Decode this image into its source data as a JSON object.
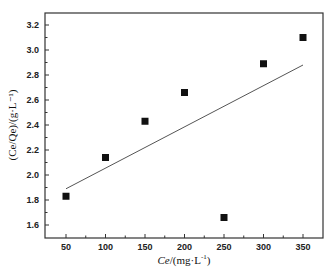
{
  "chart_data": {
    "type": "scatter",
    "title": "",
    "xlabel": "Ce/(mg·L⁻¹)",
    "ylabel": "(Ce/Qe)/(g·L⁻¹)",
    "xlim": [
      25,
      375
    ],
    "ylim": [
      1.5,
      3.3
    ],
    "x_ticks": [
      50,
      100,
      150,
      200,
      250,
      300,
      350
    ],
    "y_ticks": [
      1.6,
      1.8,
      2.0,
      2.2,
      2.4,
      2.6,
      2.8,
      3.0,
      3.2
    ],
    "grid": false,
    "legend": null,
    "series": [
      {
        "name": "data",
        "marker": "square",
        "x": [
          50,
          100,
          150,
          200,
          250,
          300,
          350
        ],
        "y": [
          1.83,
          2.14,
          2.43,
          2.66,
          1.66,
          2.89,
          3.1
        ]
      },
      {
        "name": "linear fit",
        "style": "line",
        "x": [
          50,
          350
        ],
        "y": [
          1.89,
          2.88
        ]
      }
    ]
  },
  "labels": {
    "x_title_main": "Ce",
    "x_title_unit": "/(mg·L",
    "x_title_exp": "-1",
    "x_title_close": ")",
    "y_title": "(Ce/Qe)/(g·L⁻¹)"
  }
}
